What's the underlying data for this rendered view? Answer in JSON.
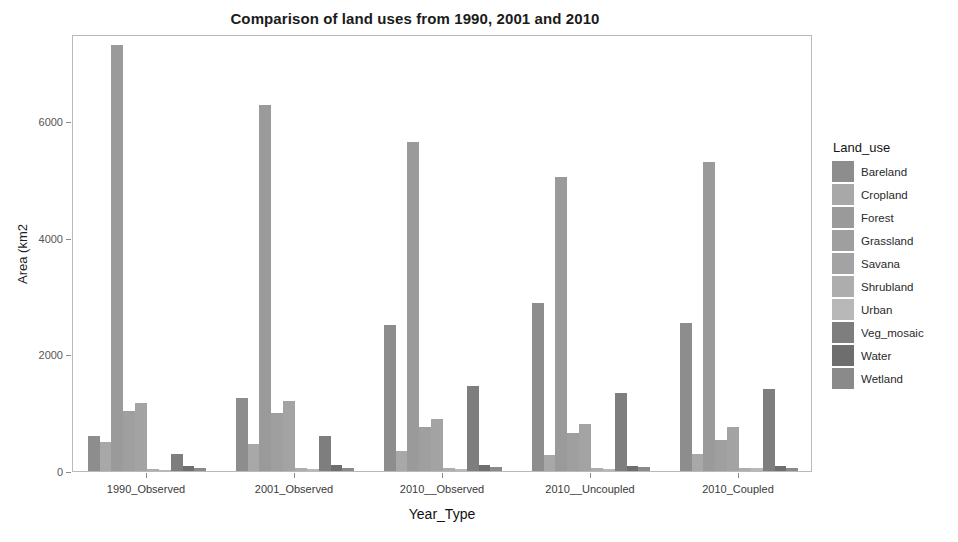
{
  "chart_data": {
    "type": "bar",
    "title": "Comparison of land uses from 1990, 2001 and 2010",
    "xlabel": "Year_Type",
    "ylabel": "Area (km2",
    "grid": false,
    "legend_position": "right",
    "legend_title": "Land_use",
    "ylim": [
      0,
      7500
    ],
    "yticks": [
      0,
      2000,
      4000,
      6000
    ],
    "ytick_labels": [
      "0",
      "2000",
      "4000",
      "6000"
    ],
    "categories": [
      "1990_Observed",
      "2001_Observed",
      "2010__Observed",
      "2010__Uncoupled",
      "2010_Coupled"
    ],
    "series": [
      {
        "name": "Bareland",
        "color": "#8d8d8d",
        "values": [
          600,
          1260,
          2500,
          2890,
          2540
        ]
      },
      {
        "name": "Cropland",
        "color": "#a8a8a8",
        "values": [
          500,
          470,
          340,
          280,
          290
        ]
      },
      {
        "name": "Forest",
        "color": "#9a9a9a",
        "values": [
          7310,
          6290,
          5650,
          5040,
          5300
        ]
      },
      {
        "name": "Grassland",
        "color": "#9f9f9f",
        "values": [
          1030,
          990,
          760,
          660,
          530
        ]
      },
      {
        "name": "Savana",
        "color": "#a3a3a3",
        "values": [
          1170,
          1210,
          890,
          810,
          750
        ]
      },
      {
        "name": "Shrubland",
        "color": "#adadad",
        "values": [
          40,
          45,
          60,
          55,
          50
        ]
      },
      {
        "name": "Urban",
        "color": "#b8b8b8",
        "values": [
          25,
          30,
          35,
          40,
          45
        ]
      },
      {
        "name": "Veg_mosaic",
        "color": "#7e7e7e",
        "values": [
          300,
          600,
          1460,
          1340,
          1400
        ]
      },
      {
        "name": "Water",
        "color": "#6e6e6e",
        "values": [
          90,
          95,
          95,
          90,
          90
        ]
      },
      {
        "name": "Wetland",
        "color": "#8a8a8a",
        "values": [
          60,
          60,
          70,
          65,
          60
        ]
      }
    ]
  }
}
